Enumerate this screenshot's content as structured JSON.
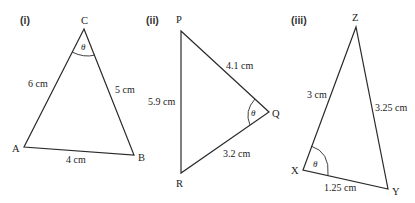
{
  "diagrams": [
    {
      "id": "i",
      "label": "(i)",
      "vertices": {
        "C": "C",
        "A": "A",
        "B": "B"
      },
      "sides": {
        "CA": "6 cm",
        "CB": "5 cm",
        "AB": "4 cm"
      },
      "angle": {
        "at": "C",
        "symbol": "θ"
      }
    },
    {
      "id": "ii",
      "label": "(ii)",
      "vertices": {
        "P": "P",
        "Q": "Q",
        "R": "R"
      },
      "sides": {
        "PQ": "4.1 cm",
        "PR": "5.9 cm",
        "QR": "3.2 cm"
      },
      "angle": {
        "at": "Q",
        "symbol": "θ"
      }
    },
    {
      "id": "iii",
      "label": "(iii)",
      "vertices": {
        "Z": "Z",
        "X": "X",
        "Y": "Y"
      },
      "sides": {
        "XZ": "3 cm",
        "YZ": "3.25 cm",
        "XY": "1.25 cm"
      },
      "angle": {
        "at": "X",
        "symbol": "θ"
      }
    }
  ]
}
